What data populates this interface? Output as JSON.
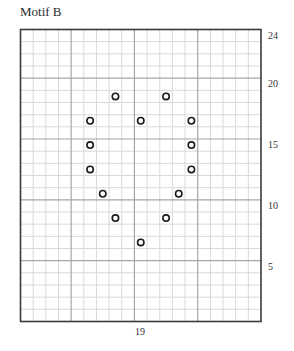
{
  "title": "Motif B",
  "chart_data": {
    "type": "table",
    "title": "Motif B",
    "grid": {
      "columns": 19,
      "rows": 24,
      "major_every": 5,
      "column_numbering": "right-to-left",
      "row_numbering": "bottom-to-top"
    },
    "row_labels": [
      {
        "row": 24,
        "label": "24"
      },
      {
        "row": 20,
        "label": "20"
      },
      {
        "row": 15,
        "label": "15"
      },
      {
        "row": 10,
        "label": "10"
      },
      {
        "row": 5,
        "label": "5"
      }
    ],
    "column_label": {
      "label": "19"
    },
    "symbol": "circle",
    "stitches": [
      {
        "row": 19,
        "col": 12
      },
      {
        "row": 19,
        "col": 8
      },
      {
        "row": 17,
        "col": 14
      },
      {
        "row": 17,
        "col": 10
      },
      {
        "row": 17,
        "col": 6
      },
      {
        "row": 15,
        "col": 14
      },
      {
        "row": 15,
        "col": 6
      },
      {
        "row": 13,
        "col": 14
      },
      {
        "row": 13,
        "col": 6
      },
      {
        "row": 11,
        "col": 13
      },
      {
        "row": 11,
        "col": 7
      },
      {
        "row": 9,
        "col": 12
      },
      {
        "row": 9,
        "col": 8
      },
      {
        "row": 7,
        "col": 10
      }
    ],
    "colors": {
      "minor_line": "#d9d9d9",
      "major_line": "#a6a6a6",
      "border": "#3a3a3a",
      "symbol": "#1a1a1a"
    }
  }
}
